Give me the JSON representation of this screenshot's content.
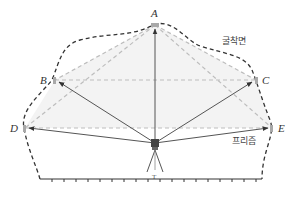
{
  "diagram": {
    "labels": {
      "excavation_surface": "굴착면",
      "prism": "프리즘",
      "instrument": "T"
    },
    "points": [
      {
        "id": "A",
        "label": "A",
        "x": 155,
        "y": 25
      },
      {
        "id": "B",
        "label": "B",
        "x": 55,
        "y": 80
      },
      {
        "id": "C",
        "label": "C",
        "x": 256,
        "y": 80
      },
      {
        "id": "D",
        "label": "D",
        "x": 25,
        "y": 128
      },
      {
        "id": "E",
        "label": "E",
        "x": 272,
        "y": 128
      }
    ],
    "instrument_position": {
      "x": 155,
      "y": 143
    },
    "colors": {
      "outline": "#333333",
      "sight_line": "#555555",
      "grid_dash": "#bbbbbb",
      "fill": "#f3f3f3",
      "prism_marker": "#999999"
    }
  }
}
